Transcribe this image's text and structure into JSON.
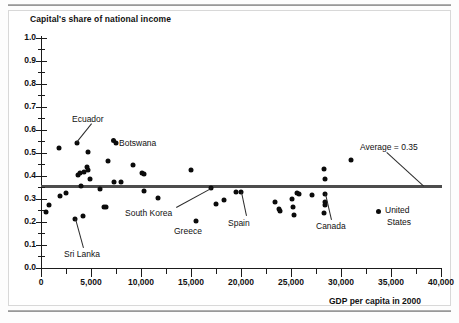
{
  "figure": {
    "title": "Capital's share of national income",
    "x_axis_title": "GDP per capita in 2000"
  },
  "chart_data": {
    "type": "scatter",
    "title": "Capital's share of national income",
    "xlabel": "GDP per capita in 2000",
    "ylabel": "Capital's share of national income",
    "xlim": [
      0,
      40000
    ],
    "ylim": [
      0.0,
      1.0
    ],
    "grid": false,
    "legend": "none",
    "x_ticks": [
      0,
      5000,
      10000,
      15000,
      20000,
      25000,
      30000,
      35000,
      40000
    ],
    "x_tick_labels": [
      "0",
      "5,000",
      "10,000",
      "15,000",
      "20,000",
      "25,000",
      "30,000",
      "35,000",
      "40,000"
    ],
    "x_minor_tick_step": 2500,
    "y_ticks": [
      0.0,
      0.1,
      0.2,
      0.3,
      0.4,
      0.5,
      0.6,
      0.7,
      0.8,
      0.9,
      1.0
    ],
    "y_tick_labels": [
      "0.0",
      "0.1",
      "0.2",
      "0.3",
      "0.4",
      "0.5",
      "0.6",
      "0.7",
      "0.8",
      "0.9",
      "1.0"
    ],
    "y_minor_tick_step": 0.05,
    "reference_line": {
      "label": "Average = 0.35",
      "value": 0.355,
      "orientation": "horizontal",
      "color": "#4d4d4d"
    },
    "marker_color": "#0b0b0b",
    "points": [
      {
        "x": 500,
        "y": 0.243
      },
      {
        "x": 800,
        "y": 0.274
      },
      {
        "x": 1800,
        "y": 0.522
      },
      {
        "x": 1900,
        "y": 0.313
      },
      {
        "x": 2500,
        "y": 0.325
      },
      {
        "x": 3400,
        "y": 0.213,
        "label": "Sri Lanka"
      },
      {
        "x": 3600,
        "y": 0.545,
        "label": "Ecuador"
      },
      {
        "x": 3700,
        "y": 0.404
      },
      {
        "x": 3900,
        "y": 0.411
      },
      {
        "x": 4000,
        "y": 0.355
      },
      {
        "x": 4200,
        "y": 0.225
      },
      {
        "x": 4300,
        "y": 0.417
      },
      {
        "x": 4600,
        "y": 0.437
      },
      {
        "x": 4650,
        "y": 0.424
      },
      {
        "x": 4700,
        "y": 0.503
      },
      {
        "x": 4900,
        "y": 0.387
      },
      {
        "x": 5900,
        "y": 0.345
      },
      {
        "x": 6300,
        "y": 0.266
      },
      {
        "x": 6450,
        "y": 0.264
      },
      {
        "x": 6700,
        "y": 0.466
      },
      {
        "x": 7300,
        "y": 0.374
      },
      {
        "x": 7500,
        "y": 0.545,
        "label": "Botswana"
      },
      {
        "x": 8000,
        "y": 0.375
      },
      {
        "x": 9200,
        "y": 0.446
      },
      {
        "x": 10100,
        "y": 0.415
      },
      {
        "x": 10300,
        "y": 0.408
      },
      {
        "x": 10300,
        "y": 0.336
      },
      {
        "x": 11700,
        "y": 0.306
      },
      {
        "x": 15000,
        "y": 0.426
      },
      {
        "x": 15500,
        "y": 0.206,
        "label": "Greece"
      },
      {
        "x": 17000,
        "y": 0.348,
        "label": "South Korea"
      },
      {
        "x": 17500,
        "y": 0.279
      },
      {
        "x": 18300,
        "y": 0.297
      },
      {
        "x": 19500,
        "y": 0.33
      },
      {
        "x": 20000,
        "y": 0.329,
        "label": "Spain"
      },
      {
        "x": 23400,
        "y": 0.289
      },
      {
        "x": 23800,
        "y": 0.256
      },
      {
        "x": 23900,
        "y": 0.25
      },
      {
        "x": 25100,
        "y": 0.3
      },
      {
        "x": 25200,
        "y": 0.264
      },
      {
        "x": 25300,
        "y": 0.23
      },
      {
        "x": 25600,
        "y": 0.324
      },
      {
        "x": 25800,
        "y": 0.321
      },
      {
        "x": 27100,
        "y": 0.318
      },
      {
        "x": 28300,
        "y": 0.43
      },
      {
        "x": 28400,
        "y": 0.389
      },
      {
        "x": 28400,
        "y": 0.322,
        "label": "Canada"
      },
      {
        "x": 28400,
        "y": 0.289
      },
      {
        "x": 28350,
        "y": 0.276
      },
      {
        "x": 28300,
        "y": 0.241
      },
      {
        "x": 31000,
        "y": 0.47
      }
    ],
    "annotations": [
      {
        "text": "Ecuador",
        "target_x": 3600,
        "target_y": 0.545
      },
      {
        "text": "Botswana",
        "target_x": 7500,
        "target_y": 0.545
      },
      {
        "text": "Sri Lanka",
        "target_x": 3400,
        "target_y": 0.213
      },
      {
        "text": "South Korea",
        "target_x": 17000,
        "target_y": 0.348
      },
      {
        "text": "Greece",
        "target_x": 15500,
        "target_y": 0.206
      },
      {
        "text": "Spain",
        "target_x": 20000,
        "target_y": 0.329
      },
      {
        "text": "Canada",
        "target_x": 28400,
        "target_y": 0.322
      },
      {
        "text": "Average = 0.35",
        "target_x": 38000,
        "target_y": 0.355
      }
    ],
    "callout_legend": {
      "label_line1": "United",
      "label_line2": "States"
    }
  },
  "labels": {
    "ecuador": "Ecuador",
    "botswana": "Botswana",
    "sri_lanka": "Sri Lanka",
    "south_korea": "South Korea",
    "greece": "Greece",
    "spain": "Spain",
    "canada": "Canada",
    "average": "Average = 0.35",
    "united": "United",
    "states": "States"
  }
}
